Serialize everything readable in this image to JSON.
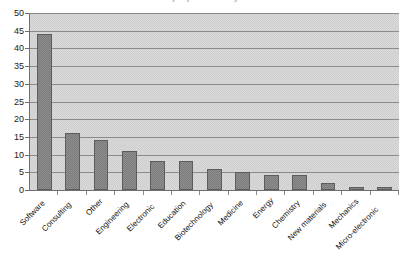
{
  "chart_data": {
    "type": "bar",
    "title": "Start-ups per activity sector",
    "xlabel": "",
    "ylabel": "",
    "ylim": [
      0,
      50
    ],
    "ytick_step": 5,
    "yticks": [
      "50",
      "45",
      "40",
      "35",
      "30",
      "25",
      "20",
      "15",
      "10",
      "5",
      "0"
    ],
    "grid": true,
    "legend": "none",
    "categories": [
      "Software",
      "Consulting",
      "Other",
      "Engineering",
      "Electronic",
      "Education",
      "Biotechnology",
      "Medicine",
      "Energy",
      "Chemistry",
      "New materials",
      "Mechanics",
      "Micro-electronic"
    ],
    "values": [
      44,
      16,
      14,
      11,
      8.3,
      8.3,
      6,
      5.2,
      4.2,
      4.2,
      2,
      0.8,
      0.8
    ],
    "colors": {
      "bar_fill": "#7b7b7b",
      "bar_border": "#5d5d5d",
      "plot_background": "#d9d9d9",
      "gridline": "#8a8a8a",
      "axis": "#6f6f6f",
      "text": "#111111"
    }
  }
}
